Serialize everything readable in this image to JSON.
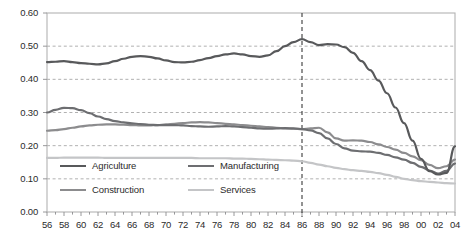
{
  "chart_data": {
    "type": "line",
    "title": "",
    "xlabel": "",
    "ylabel": "",
    "xlim": [
      1956,
      2004
    ],
    "ylim": [
      0.0,
      0.6
    ],
    "grid": true,
    "grid_style": "dashed horizontal",
    "legend_position": "inside lower-left",
    "annotations": [
      {
        "type": "vertical-line",
        "x": 1986,
        "style": "dashed",
        "label": ""
      }
    ],
    "x": [
      1956,
      1957,
      1958,
      1959,
      1960,
      1961,
      1962,
      1963,
      1964,
      1965,
      1966,
      1967,
      1968,
      1969,
      1970,
      1971,
      1972,
      1973,
      1974,
      1975,
      1976,
      1977,
      1978,
      1979,
      1980,
      1981,
      1982,
      1983,
      1984,
      1985,
      1986,
      1987,
      1988,
      1989,
      1990,
      1991,
      1992,
      1993,
      1994,
      1995,
      1996,
      1997,
      1998,
      1999,
      2000,
      2001,
      2002,
      2003,
      2004
    ],
    "xtick_labels": [
      "56",
      "57",
      "58",
      "59",
      "60",
      "61",
      "62",
      "63",
      "64",
      "65",
      "66",
      "67",
      "68",
      "69",
      "70",
      "71",
      "72",
      "73",
      "74",
      "75",
      "76",
      "77",
      "78",
      "79",
      "80",
      "81",
      "82",
      "83",
      "84",
      "85",
      "86",
      "87",
      "88",
      "89",
      "90",
      "91",
      "92",
      "93",
      "94",
      "95",
      "96",
      "97",
      "98",
      "99",
      "00",
      "01",
      "02",
      "03",
      "04"
    ],
    "xtick_labels_shown": [
      "56",
      "58",
      "60",
      "62",
      "64",
      "66",
      "68",
      "70",
      "72",
      "74",
      "76",
      "78",
      "80",
      "82",
      "84",
      "86",
      "88",
      "90",
      "92",
      "94",
      "96",
      "98",
      "00",
      "02",
      "04"
    ],
    "ytick_labels": [
      "0.00",
      "0.10",
      "0.20",
      "0.30",
      "0.40",
      "0.50",
      "0.60"
    ],
    "ytick_values": [
      0.0,
      0.1,
      0.2,
      0.3,
      0.4,
      0.5,
      0.6
    ],
    "series": [
      {
        "name": "Agriculture",
        "color": "#58595b",
        "width": 2.2,
        "values": [
          0.452,
          0.453,
          0.455,
          0.452,
          0.449,
          0.447,
          0.445,
          0.448,
          0.455,
          0.462,
          0.468,
          0.47,
          0.468,
          0.463,
          0.457,
          0.452,
          0.451,
          0.453,
          0.458,
          0.464,
          0.47,
          0.475,
          0.478,
          0.475,
          0.47,
          0.468,
          0.472,
          0.485,
          0.5,
          0.512,
          0.521,
          0.512,
          0.503,
          0.506,
          0.505,
          0.497,
          0.48,
          0.455,
          0.428,
          0.396,
          0.358,
          0.315,
          0.268,
          0.215,
          0.16,
          0.123,
          0.113,
          0.118,
          0.198
        ]
      },
      {
        "name": "Manufacturing",
        "color": "#6d6e71",
        "width": 2.2,
        "values": [
          0.3,
          0.308,
          0.314,
          0.313,
          0.307,
          0.298,
          0.288,
          0.28,
          0.274,
          0.27,
          0.267,
          0.265,
          0.263,
          0.262,
          0.262,
          0.262,
          0.261,
          0.259,
          0.258,
          0.257,
          0.258,
          0.259,
          0.258,
          0.256,
          0.254,
          0.252,
          0.251,
          0.252,
          0.253,
          0.252,
          0.25,
          0.246,
          0.238,
          0.222,
          0.205,
          0.192,
          0.185,
          0.183,
          0.182,
          0.178,
          0.172,
          0.165,
          0.158,
          0.148,
          0.136,
          0.125,
          0.116,
          0.124,
          0.146
        ]
      },
      {
        "name": "Construction",
        "color": "#8c8c8e",
        "width": 2.2,
        "values": [
          0.245,
          0.247,
          0.25,
          0.254,
          0.258,
          0.261,
          0.263,
          0.264,
          0.264,
          0.263,
          0.262,
          0.261,
          0.261,
          0.262,
          0.264,
          0.266,
          0.268,
          0.27,
          0.271,
          0.27,
          0.268,
          0.266,
          0.264,
          0.262,
          0.26,
          0.258,
          0.256,
          0.254,
          0.252,
          0.251,
          0.25,
          0.252,
          0.254,
          0.24,
          0.222,
          0.215,
          0.216,
          0.215,
          0.211,
          0.204,
          0.196,
          0.188,
          0.178,
          0.168,
          0.156,
          0.142,
          0.132,
          0.138,
          0.158
        ]
      },
      {
        "name": "Services",
        "color": "#c4c5c7",
        "width": 2.2,
        "values": [
          0.163,
          0.163,
          0.164,
          0.164,
          0.164,
          0.164,
          0.164,
          0.163,
          0.163,
          0.163,
          0.163,
          0.163,
          0.163,
          0.163,
          0.163,
          0.163,
          0.163,
          0.163,
          0.162,
          0.162,
          0.162,
          0.162,
          0.161,
          0.161,
          0.16,
          0.159,
          0.158,
          0.157,
          0.156,
          0.155,
          0.153,
          0.148,
          0.143,
          0.138,
          0.133,
          0.129,
          0.126,
          0.124,
          0.121,
          0.117,
          0.112,
          0.106,
          0.1,
          0.096,
          0.093,
          0.091,
          0.089,
          0.087,
          0.086
        ]
      }
    ]
  },
  "legend": {
    "items": [
      {
        "label": "Agriculture",
        "color": "#58595b"
      },
      {
        "label": "Manufacturing",
        "color": "#6d6e71"
      },
      {
        "label": "Construction",
        "color": "#8c8c8e"
      },
      {
        "label": "Services",
        "color": "#c4c5c7"
      }
    ]
  },
  "axes": {
    "frame_color": "#b3b3b3",
    "grid_color": "#a8a8a8",
    "tick_color": "#8c8c8e",
    "label_color": "#2b2b2b"
  }
}
